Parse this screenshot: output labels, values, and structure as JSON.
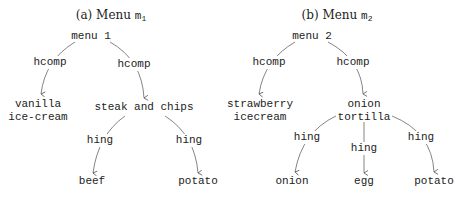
{
  "panels": [
    {
      "caption": {
        "prefix": "(a) Menu",
        "var": "m",
        "sub": "1"
      },
      "root": "menu 1",
      "children": [
        {
          "label": "vanilla",
          "label2": "ice-cream",
          "edge": "hcomp"
        },
        {
          "label": "steak and chips",
          "edge": "hcomp",
          "children": [
            {
              "label": "beef",
              "edge": "hing"
            },
            {
              "label": "potato",
              "edge": "hing"
            }
          ]
        }
      ]
    },
    {
      "caption": {
        "prefix": "(b) Menu",
        "var": "m",
        "sub": "2"
      },
      "root": "menu 2",
      "children": [
        {
          "label": "strawberry",
          "label2": "icecream",
          "edge": "hcomp"
        },
        {
          "label": "onion",
          "label2": "tortilla",
          "edge": "hcomp",
          "children": [
            {
              "label": "onion",
              "edge": "hing"
            },
            {
              "label": "egg",
              "edge": "hing"
            },
            {
              "label": "potato",
              "edge": "hing"
            }
          ]
        }
      ]
    }
  ],
  "colors": {
    "text": "#222222",
    "edge": "#555555",
    "background": "#ffffff"
  }
}
